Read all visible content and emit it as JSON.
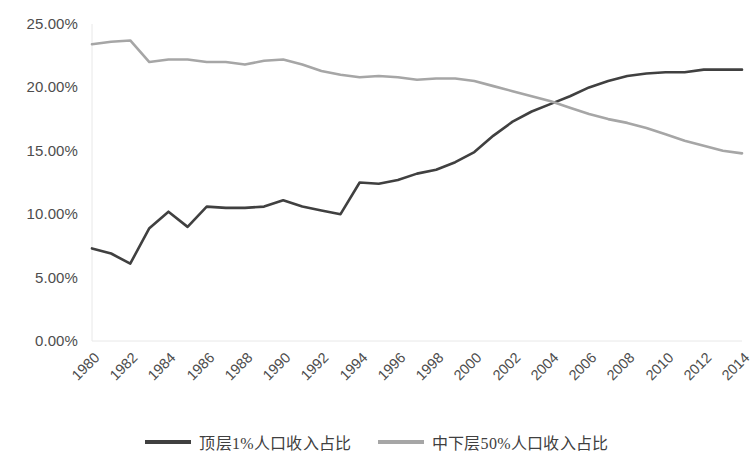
{
  "chart_data": {
    "type": "line",
    "title": "",
    "subtitle": "",
    "xlabel": "",
    "ylabel": "",
    "x": [
      1980,
      1981,
      1982,
      1983,
      1984,
      1985,
      1986,
      1987,
      1988,
      1989,
      1990,
      1991,
      1992,
      1993,
      1994,
      1995,
      1996,
      1997,
      1998,
      1999,
      2000,
      2001,
      2002,
      2003,
      2004,
      2005,
      2006,
      2007,
      2008,
      2009,
      2010,
      2011,
      2012,
      2013,
      2014
    ],
    "xlim": [
      1980,
      2014
    ],
    "ylim": [
      0,
      25
    ],
    "ytick_labels": [
      "25.00%",
      "20.00%",
      "15.00%",
      "10.00%",
      "5.00%",
      "0.00%"
    ],
    "ytick_values": [
      25,
      20,
      15,
      10,
      5,
      0
    ],
    "xtick_labels": [
      "1980",
      "1982",
      "1984",
      "1986",
      "1988",
      "1990",
      "1992",
      "1994",
      "1996",
      "1998",
      "2000",
      "2002",
      "2004",
      "2006",
      "2008",
      "2010",
      "2012",
      "2014"
    ],
    "xtick_values": [
      1980,
      1982,
      1984,
      1986,
      1988,
      1990,
      1992,
      1994,
      1996,
      1998,
      2000,
      2002,
      2004,
      2006,
      2008,
      2010,
      2012,
      2014
    ],
    "xtick_rotation": -45,
    "grid": false,
    "legend_position": "bottom",
    "series": [
      {
        "name": "顶层1%人口收入占比",
        "color": "#404040",
        "values": [
          7.3,
          6.9,
          6.1,
          8.9,
          10.2,
          9.0,
          10.6,
          10.5,
          10.5,
          10.6,
          11.1,
          10.6,
          10.3,
          10.0,
          12.5,
          12.4,
          12.7,
          13.2,
          13.5,
          14.1,
          14.9,
          16.2,
          17.3,
          18.1,
          18.7,
          19.3,
          20.0,
          20.5,
          20.9,
          21.1,
          21.2,
          21.2,
          21.4,
          21.4,
          21.4
        ]
      },
      {
        "name": "中下层50%人口收入占比",
        "color": "#a6a6a6",
        "values": [
          23.4,
          23.6,
          23.7,
          22.0,
          22.2,
          22.2,
          22.0,
          22.0,
          21.8,
          22.1,
          22.2,
          21.8,
          21.3,
          21.0,
          20.8,
          20.9,
          20.8,
          20.6,
          20.7,
          20.7,
          20.5,
          20.1,
          19.7,
          19.3,
          18.9,
          18.4,
          17.9,
          17.5,
          17.2,
          16.8,
          16.3,
          15.8,
          15.4,
          15.0,
          14.8
        ]
      }
    ]
  },
  "legend": {
    "items": [
      {
        "label": "顶层1%人口收入占比",
        "color": "#404040"
      },
      {
        "label": "中下层50%人口收入占比",
        "color": "#a6a6a6"
      }
    ]
  }
}
